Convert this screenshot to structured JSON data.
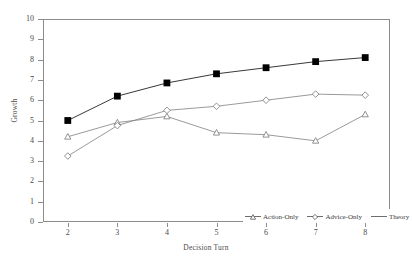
{
  "chart_data": {
    "type": "line",
    "title": "",
    "xlabel": "Decision Turn",
    "ylabel": "Growth",
    "x": [
      2,
      3,
      4,
      5,
      6,
      7,
      8
    ],
    "xlim": [
      1.5,
      8.5
    ],
    "ylim": [
      0,
      10
    ],
    "yticks": [
      0,
      1,
      2,
      3,
      4,
      5,
      6,
      7,
      8,
      9,
      10
    ],
    "xticks": [
      2,
      3,
      4,
      5,
      6,
      7,
      8
    ],
    "grid": false,
    "legend_position": "bottom-right",
    "series": [
      {
        "name": "Action-Only",
        "marker": "triangle-open",
        "color": "#666666",
        "values": [
          4.2,
          4.9,
          5.2,
          4.4,
          4.3,
          4.0,
          5.3
        ]
      },
      {
        "name": "Advice-Only",
        "marker": "diamond-open",
        "color": "#666666",
        "values": [
          3.25,
          4.75,
          5.5,
          5.7,
          6.0,
          6.3,
          6.25
        ]
      },
      {
        "name": "Theory",
        "marker": "square-filled",
        "color": "#000000",
        "values": [
          5.0,
          6.2,
          6.85,
          7.3,
          7.6,
          7.9,
          8.1
        ]
      }
    ]
  },
  "axis": {
    "y_tick_labels": [
      "10",
      "9",
      "8",
      "7",
      "6",
      "5",
      "4",
      "3",
      "2",
      "1",
      "0"
    ],
    "x_tick_labels": [
      "2",
      "3",
      "4",
      "5",
      "6",
      "7",
      "8"
    ],
    "x_title": "Decision Turn",
    "y_title": "Growth"
  },
  "legend": {
    "items": [
      {
        "label": "Action-Only",
        "marker": "triangle-open-icon"
      },
      {
        "label": "Advice-Only",
        "marker": "diamond-open-icon"
      },
      {
        "label": "Theory",
        "marker": "square-filled-icon"
      }
    ]
  }
}
